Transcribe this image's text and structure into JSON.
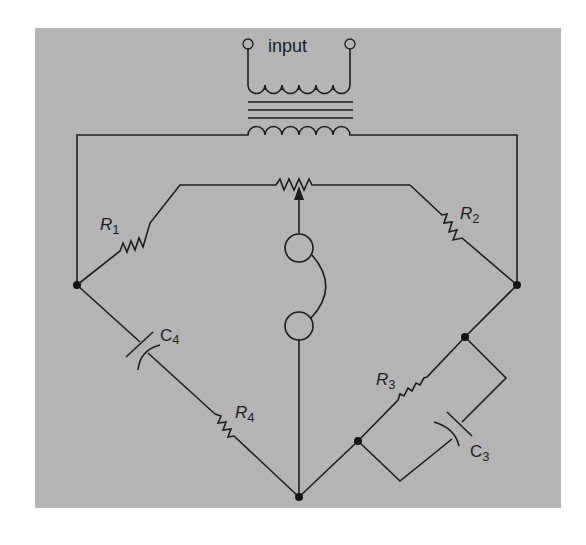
{
  "diagram": {
    "type": "ac-bridge-circuit",
    "input_label": "input",
    "components": {
      "R1": {
        "letter": "R",
        "sub": "1"
      },
      "R2": {
        "letter": "R",
        "sub": "2"
      },
      "R3": {
        "letter": "R",
        "sub": "3"
      },
      "R4": {
        "letter": "R",
        "sub": "4"
      },
      "C3": {
        "letter": "C",
        "sub": "3"
      },
      "C4": {
        "letter": "C",
        "sub": "4"
      }
    },
    "elements": [
      "input-terminal-left",
      "input-terminal-right",
      "transformer",
      "potentiometer",
      "headphone-detector",
      "R1",
      "R2",
      "R3",
      "R4",
      "C3",
      "C4"
    ],
    "colors": {
      "background": "#b4b4b4",
      "ink": "#1e1e1e",
      "page": "#ffffff"
    }
  }
}
